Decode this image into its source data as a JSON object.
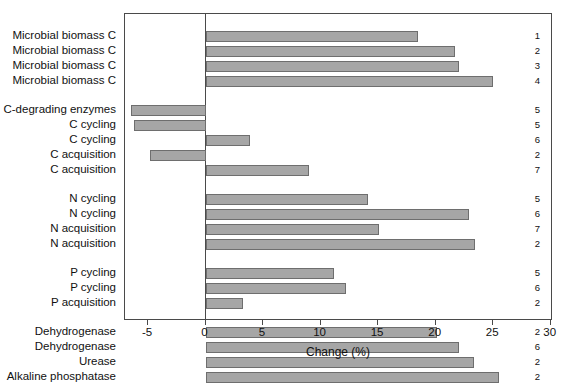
{
  "chart_data": {
    "type": "bar",
    "orientation": "horizontal",
    "title": "",
    "xlabel": "Change (%)",
    "ylabel": "",
    "xlim": [
      -7.0,
      30.2
    ],
    "xticks": [
      -5,
      0,
      5,
      10,
      15,
      20,
      25,
      30
    ],
    "xticklabels": [
      "-5",
      "0",
      "5",
      "10",
      "15",
      "20",
      "25",
      "30"
    ],
    "grid": false,
    "legend": false,
    "zero_reference_line": 0,
    "bar_color": "#a6a6a6",
    "bar_edge_color": "#6e6e6e",
    "groups": [
      {
        "name": "Microbial biomass C",
        "rows": [
          {
            "category": "Microbial biomass C",
            "value": 18.5,
            "ref": "1"
          },
          {
            "category": "Microbial biomass C",
            "value": 21.7,
            "ref": "2"
          },
          {
            "category": "Microbial biomass C",
            "value": 22.0,
            "ref": "3"
          },
          {
            "category": "Microbial biomass C",
            "value": 25.0,
            "ref": "4"
          }
        ]
      },
      {
        "name": "C",
        "rows": [
          {
            "category": "C-degrading enzymes",
            "value": -6.5,
            "ref": "5"
          },
          {
            "category": "C cycling",
            "value": -6.2,
            "ref": "5"
          },
          {
            "category": "C cycling",
            "value": 3.9,
            "ref": "6"
          },
          {
            "category": "C acquisition",
            "value": -4.8,
            "ref": "2"
          },
          {
            "category": "C acquisition",
            "value": 9.0,
            "ref": "7"
          }
        ]
      },
      {
        "name": "N",
        "rows": [
          {
            "category": "N cycling",
            "value": 14.1,
            "ref": "5"
          },
          {
            "category": "N cycling",
            "value": 22.9,
            "ref": "6"
          },
          {
            "category": "N acquisition",
            "value": 15.1,
            "ref": "7"
          },
          {
            "category": "N acquisition",
            "value": 23.4,
            "ref": "2"
          }
        ]
      },
      {
        "name": "P",
        "rows": [
          {
            "category": "P cycling",
            "value": 11.2,
            "ref": "5"
          },
          {
            "category": "P cycling",
            "value": 12.2,
            "ref": "6"
          },
          {
            "category": "P acquisition",
            "value": 3.3,
            "ref": "2"
          }
        ]
      },
      {
        "name": "Enzymes",
        "rows": [
          {
            "category": "Dehydrogenase",
            "value": 20.1,
            "ref": "2"
          },
          {
            "category": "Dehydrogenase",
            "value": 22.0,
            "ref": "6"
          },
          {
            "category": "Urease",
            "value": 23.3,
            "ref": "2"
          },
          {
            "category": "Alkaline phosphatase",
            "value": 25.5,
            "ref": "2"
          }
        ]
      }
    ]
  }
}
